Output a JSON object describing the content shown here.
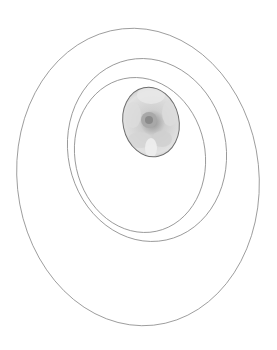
{
  "figure": {
    "stroke_color": "#8a8a8a",
    "background": "#ffffff",
    "rings": [
      {
        "name": "outer",
        "cx": 138,
        "cy": 177,
        "rx": 121,
        "ry": 149,
        "rotate": -6
      },
      {
        "name": "middle",
        "cx": 147,
        "cy": 150,
        "rx": 79,
        "ry": 92,
        "rotate": -12
      },
      {
        "name": "inner",
        "cx": 140,
        "cy": 155,
        "rx": 65,
        "ry": 78,
        "rotate": -12
      }
    ],
    "photo": {
      "subject": "flower",
      "tone": "grayscale",
      "cx": 151,
      "cy": 122,
      "rx": 28,
      "ry": 35,
      "rotate": -12
    }
  }
}
